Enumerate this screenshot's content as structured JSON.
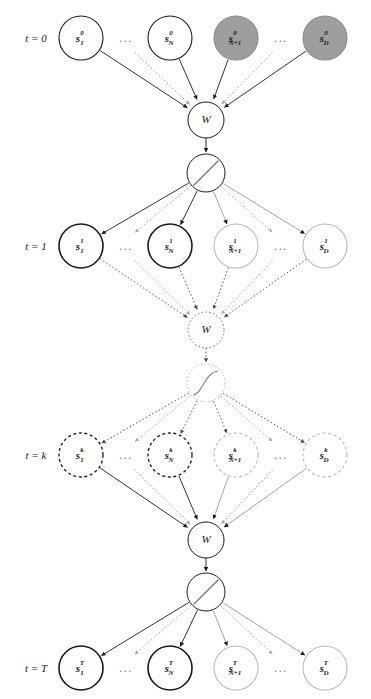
{
  "figure": {
    "width": 371,
    "height": 699,
    "background": "#ffffff"
  },
  "colors": {
    "dark": "#1a1a1a",
    "bold_stroke": "#111111",
    "light_stroke": "#b9b9b9",
    "mid_stroke": "#6e6e6e",
    "gray_fill": "#9e9e9e",
    "gray_fill_stroke": "#8a8a8a",
    "dashed_dark": "#333333",
    "dashed_light": "#c2c2c2",
    "white_fill": "#ffffff",
    "ellipsis": "#7a7a7a"
  },
  "geometry": {
    "columns_x": [
      81,
      170,
      236,
      325
    ],
    "ellipsis_x": [
      126,
      281
    ],
    "row_y": [
      38,
      246,
      455,
      668
    ],
    "w_y": [
      120,
      330,
      540
    ],
    "act_y": [
      173,
      383,
      592
    ],
    "node_r": 22,
    "w_r": 18,
    "act_r": 19,
    "label_x": 36
  },
  "time_labels": [
    {
      "id": "t0",
      "text": "t = 0",
      "y": 38,
      "style": "solid"
    },
    {
      "id": "t1",
      "text": "t = 1",
      "y": 246,
      "style": "solid"
    },
    {
      "id": "tk",
      "text": "t = k",
      "y": 455,
      "style": "solid"
    },
    {
      "id": "tT",
      "text": "t = T",
      "y": 668,
      "style": "solid"
    }
  ],
  "rows": [
    {
      "id": "row-t0",
      "time": "t = 0",
      "superscript": "0",
      "edge_style": "solid",
      "nodes": [
        {
          "id": "s1-t0",
          "base": "s",
          "sub": "1",
          "sup": "0",
          "fill": "white",
          "stroke": "dark",
          "stroke_style": "solid",
          "stroke_width": 1.1
        },
        {
          "id": "sN-t0",
          "base": "s",
          "sub": "N",
          "sup": "0",
          "fill": "white",
          "stroke": "dark",
          "stroke_style": "solid",
          "stroke_width": 1.1
        },
        {
          "id": "sN1-t0",
          "base": "s",
          "sub": "N+1",
          "sup": "0",
          "fill": "gray",
          "stroke": "gray",
          "stroke_style": "solid",
          "stroke_width": 1.1
        },
        {
          "id": "sD-t0",
          "base": "s",
          "sub": "D",
          "sup": "0",
          "fill": "gray",
          "stroke": "gray",
          "stroke_style": "solid",
          "stroke_width": 1.1
        }
      ],
      "ellipses": [
        "...",
        "..."
      ]
    },
    {
      "id": "row-t1",
      "time": "t = 1",
      "superscript": "1",
      "edge_style": "solid",
      "nodes": [
        {
          "id": "s1-t1",
          "base": "s",
          "sub": "1",
          "sup": "1",
          "fill": "white",
          "stroke": "dark",
          "stroke_style": "solid",
          "stroke_width": 1.6
        },
        {
          "id": "sN-t1",
          "base": "s",
          "sub": "N",
          "sup": "1",
          "fill": "white",
          "stroke": "dark",
          "stroke_style": "solid",
          "stroke_width": 1.6
        },
        {
          "id": "sN1-t1",
          "base": "s",
          "sub": "N+1",
          "sup": "1",
          "fill": "white",
          "stroke": "light",
          "stroke_style": "solid",
          "stroke_width": 1.1
        },
        {
          "id": "sD-t1",
          "base": "s",
          "sub": "D",
          "sup": "1",
          "fill": "white",
          "stroke": "light",
          "stroke_style": "solid",
          "stroke_width": 1.1
        }
      ],
      "ellipses": [
        "...",
        "..."
      ]
    },
    {
      "id": "row-tk",
      "time": "t = k",
      "superscript": "k",
      "edge_style": "dotted",
      "nodes": [
        {
          "id": "s1-tk",
          "base": "s",
          "sub": "1",
          "sup": "k",
          "fill": "white",
          "stroke": "dark",
          "stroke_style": "dashed",
          "stroke_width": 1.3
        },
        {
          "id": "sN-tk",
          "base": "s",
          "sub": "N",
          "sup": "k",
          "fill": "white",
          "stroke": "dark",
          "stroke_style": "dashed",
          "stroke_width": 1.3
        },
        {
          "id": "sN1-tk",
          "base": "s",
          "sub": "N+1",
          "sup": "k",
          "fill": "white",
          "stroke": "light",
          "stroke_style": "dashed",
          "stroke_width": 1.1
        },
        {
          "id": "sD-tk",
          "base": "s",
          "sub": "D",
          "sup": "k",
          "fill": "white",
          "stroke": "light",
          "stroke_style": "dashed",
          "stroke_width": 1.1
        }
      ],
      "ellipses": [
        "...",
        "..."
      ]
    },
    {
      "id": "row-tT",
      "time": "t = T",
      "superscript": "T",
      "edge_style": "solid",
      "nodes": [
        {
          "id": "s1-tT",
          "base": "s",
          "sub": "1",
          "sup": "T",
          "fill": "white",
          "stroke": "dark",
          "stroke_style": "solid",
          "stroke_width": 1.6
        },
        {
          "id": "sN-tT",
          "base": "s",
          "sub": "N",
          "sup": "T",
          "fill": "white",
          "stroke": "dark",
          "stroke_style": "solid",
          "stroke_width": 1.6
        },
        {
          "id": "sN1-tT",
          "base": "s",
          "sub": "N+1",
          "sup": "T",
          "fill": "white",
          "stroke": "light",
          "stroke_style": "solid",
          "stroke_width": 1.1
        },
        {
          "id": "sD-tT",
          "base": "s",
          "sub": "D",
          "sup": "T",
          "fill": "white",
          "stroke": "light",
          "stroke_style": "solid",
          "stroke_width": 1.1
        }
      ],
      "ellipses": [
        "...",
        "..."
      ]
    }
  ],
  "weight_nodes": [
    {
      "id": "w-0",
      "label": "W",
      "y": 120,
      "stroke_style": "solid",
      "stroke": "dark"
    },
    {
      "id": "w-1",
      "label": "W",
      "y": 330,
      "stroke_style": "dotted",
      "stroke": "dark"
    },
    {
      "id": "w-2",
      "label": "W",
      "y": 540,
      "stroke_style": "solid",
      "stroke": "dark"
    }
  ],
  "activation_nodes": [
    {
      "id": "act-0",
      "y": 173,
      "glyph": "linear-slash",
      "stroke_style": "solid",
      "stroke": "dark"
    },
    {
      "id": "act-1",
      "y": 383,
      "glyph": "sigmoid-curve",
      "stroke_style": "dotted",
      "stroke": "light"
    },
    {
      "id": "act-2",
      "y": 592,
      "glyph": "linear-slash",
      "stroke_style": "solid",
      "stroke": "dark"
    }
  ],
  "ellipsis_text": "...",
  "legend_notes": {
    "gray_nodes": "shaded input / observed units",
    "bold_nodes": "first N state units",
    "dashed_nodes": "intermediate unrolled step"
  }
}
